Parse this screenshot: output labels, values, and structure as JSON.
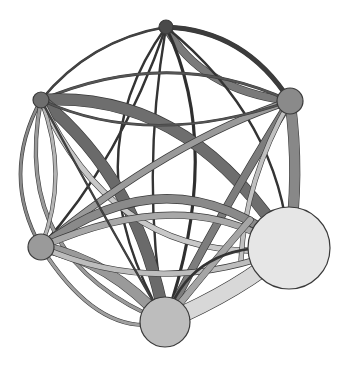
{
  "diagram": {
    "type": "network-graph",
    "width": 347,
    "height": 370,
    "nodes": [
      {
        "id": "n1",
        "x": 166,
        "y": 27,
        "r": 7,
        "fill": "#4a4a4a"
      },
      {
        "id": "n2",
        "x": 41,
        "y": 100,
        "r": 8,
        "fill": "#6e6e6e"
      },
      {
        "id": "n3",
        "x": 290,
        "y": 101,
        "r": 13,
        "fill": "#8a8a8a"
      },
      {
        "id": "n4",
        "x": 41,
        "y": 247,
        "r": 13,
        "fill": "#9a9a9a"
      },
      {
        "id": "n5",
        "x": 165,
        "y": 322,
        "r": 25,
        "fill": "#bdbdbd"
      },
      {
        "id": "n6",
        "x": 289,
        "y": 248,
        "r": 41,
        "fill": "#e6e6e6"
      }
    ],
    "edges": [
      {
        "d": "M166,27 Q245,30 290,101",
        "w": 4,
        "color": "#3c3c3c"
      },
      {
        "d": "M166,27 Q90,40 41,100",
        "w": 1.5,
        "color": "#444444"
      },
      {
        "d": "M166,27 Q200,90 290,101",
        "w": 7,
        "color": "#7a7a7a"
      },
      {
        "d": "M166,27 Q120,160 41,247",
        "w": 1.2,
        "color": "#333333"
      },
      {
        "d": "M166,27 Q225,150 165,322",
        "w": 2,
        "color": "#2e2e2e"
      },
      {
        "d": "M166,27 Q140,180 165,322",
        "w": 1.2,
        "color": "#333333"
      },
      {
        "d": "M166,27 Q280,120 289,248",
        "w": 1.2,
        "color": "#333333"
      },
      {
        "d": "M166,27 Q70,160 165,322",
        "w": 1.2,
        "color": "#333333"
      },
      {
        "d": "M41,100 Q170,45 290,101",
        "w": 2,
        "color": "#555555"
      },
      {
        "d": "M41,100 Q190,90 289,248",
        "w": 11,
        "color": "#6e6e6e"
      },
      {
        "d": "M41,100 Q140,180 165,322",
        "w": 11,
        "color": "#6a6a6a"
      },
      {
        "d": "M41,100 Q0,175 41,247",
        "w": 2.5,
        "color": "#8a8a8a"
      },
      {
        "d": "M41,100 Q10,260 165,322",
        "w": 3,
        "color": "#9a9a9a"
      },
      {
        "d": "M41,100 Q120,270 289,248",
        "w": 5,
        "color": "#c8c8c8"
      },
      {
        "d": "M41,100 Q70,175 41,247",
        "w": 3,
        "color": "#b5b5b5"
      },
      {
        "d": "M290,101 Q170,140 41,247",
        "w": 6,
        "color": "#9a9a9a"
      },
      {
        "d": "M290,101 Q210,230 165,322",
        "w": 7,
        "color": "#7d7d7d"
      },
      {
        "d": "M290,101 Q300,175 289,248",
        "w": 10,
        "color": "#888888"
      },
      {
        "d": "M290,101 Q150,150 41,100",
        "w": 1.5,
        "color": "#555555"
      },
      {
        "d": "M290,101 Q245,180 241,260",
        "w": 4,
        "color": "#c0c0c0"
      },
      {
        "d": "M41,247 Q170,150 289,248",
        "w": 8,
        "color": "#8a8a8a"
      },
      {
        "d": "M41,247 Q170,190 260,235",
        "w": 6,
        "color": "#a8a8a8"
      },
      {
        "d": "M41,247 Q110,260 165,322",
        "w": 10,
        "color": "#9a9a9a"
      },
      {
        "d": "M41,247 Q160,300 289,248",
        "w": 5,
        "color": "#bdbdbd"
      },
      {
        "d": "M41,247 Q100,340 165,322",
        "w": 3,
        "color": "#a0a0a0"
      },
      {
        "d": "M165,322 Q240,290 289,248",
        "w": 16,
        "color": "#d8d8d8"
      },
      {
        "d": "M165,322 Q215,260 250,220",
        "w": 6,
        "color": "#a5a5a5"
      },
      {
        "d": "M165,322 Q190,240 289,248",
        "w": 1.5,
        "color": "#333333"
      },
      {
        "d": "M165,322 Q100,210 41,100",
        "w": 1.2,
        "color": "#444444"
      }
    ]
  }
}
